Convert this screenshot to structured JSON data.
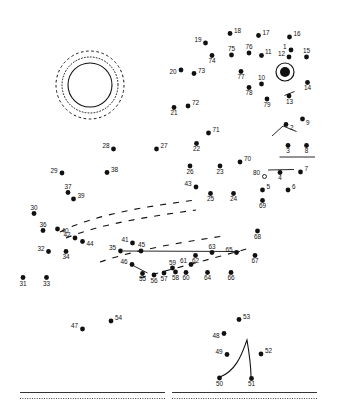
{
  "page": {
    "width": 338,
    "height": 412,
    "background_color": "#ffffff",
    "ink_color": "#111111"
  },
  "dots": {
    "marker_radius": 2.4,
    "label_font_size": 6.4,
    "items": [
      {
        "n": "1",
        "x": 291.0,
        "y": 50.0,
        "lx": 286.5,
        "ly": 48.5,
        "anchor": "end"
      },
      {
        "n": "2",
        "x": 286.0,
        "y": 124.5,
        "lx": 290.0,
        "ly": 129.5,
        "anchor": "start"
      },
      {
        "n": "3",
        "x": 288.0,
        "y": 145.5,
        "lx": 288.0,
        "ly": 153.0,
        "anchor": "middle"
      },
      {
        "n": "4",
        "x": 280.0,
        "y": 172.5,
        "lx": 280.0,
        "ly": 180.0,
        "anchor": "middle"
      },
      {
        "n": "5",
        "x": 262.5,
        "y": 190.0,
        "lx": 266.5,
        "ly": 189.0,
        "anchor": "start"
      },
      {
        "n": "6",
        "x": 288.0,
        "y": 190.0,
        "lx": 292.0,
        "ly": 189.0,
        "anchor": "start"
      },
      {
        "n": "7",
        "x": 300.5,
        "y": 172.0,
        "lx": 304.5,
        "ly": 171.0,
        "anchor": "start"
      },
      {
        "n": "8",
        "x": 306.5,
        "y": 145.5,
        "lx": 306.5,
        "ly": 153.0,
        "anchor": "middle"
      },
      {
        "n": "9",
        "x": 302.5,
        "y": 119.0,
        "lx": 306.0,
        "ly": 124.5,
        "anchor": "start"
      },
      {
        "n": "10",
        "x": 261.5,
        "y": 84.0,
        "lx": 261.5,
        "ly": 80.0,
        "anchor": "middle"
      },
      {
        "n": "11",
        "x": 261.5,
        "y": 55.5,
        "lx": 265.0,
        "ly": 54.0,
        "anchor": "start"
      },
      {
        "n": "12",
        "x": 289.0,
        "y": 57.0,
        "lx": 285.0,
        "ly": 55.5,
        "anchor": "end"
      },
      {
        "n": "13",
        "x": 289.0,
        "y": 96.0,
        "lx": 289.5,
        "ly": 103.5,
        "anchor": "middle"
      },
      {
        "n": "14",
        "x": 307.5,
        "y": 82.5,
        "lx": 307.5,
        "ly": 90.0,
        "anchor": "middle"
      },
      {
        "n": "15",
        "x": 306.5,
        "y": 57.0,
        "lx": 306.5,
        "ly": 53.0,
        "anchor": "middle"
      },
      {
        "n": "16",
        "x": 289.5,
        "y": 37.0,
        "lx": 293.5,
        "ly": 36.0,
        "anchor": "start"
      },
      {
        "n": "17",
        "x": 258.5,
        "y": 35.5,
        "lx": 262.5,
        "ly": 34.5,
        "anchor": "start"
      },
      {
        "n": "18",
        "x": 230.0,
        "y": 33.5,
        "lx": 234.0,
        "ly": 32.5,
        "anchor": "start"
      },
      {
        "n": "19",
        "x": 205.5,
        "y": 43.0,
        "lx": 201.5,
        "ly": 42.0,
        "anchor": "end"
      },
      {
        "n": "20",
        "x": 181.0,
        "y": 70.0,
        "lx": 176.5,
        "ly": 74.0,
        "anchor": "end"
      },
      {
        "n": "21",
        "x": 174.0,
        "y": 107.5,
        "lx": 174.0,
        "ly": 115.0,
        "anchor": "middle"
      },
      {
        "n": "22",
        "x": 196.5,
        "y": 143.5,
        "lx": 196.5,
        "ly": 151.0,
        "anchor": "middle"
      },
      {
        "n": "23",
        "x": 220.0,
        "y": 166.0,
        "lx": 220.0,
        "ly": 173.5,
        "anchor": "middle"
      },
      {
        "n": "24",
        "x": 233.5,
        "y": 193.5,
        "lx": 233.5,
        "ly": 201.0,
        "anchor": "middle"
      },
      {
        "n": "25",
        "x": 210.5,
        "y": 193.5,
        "lx": 210.5,
        "ly": 201.0,
        "anchor": "middle"
      },
      {
        "n": "26",
        "x": 190.0,
        "y": 166.0,
        "lx": 190.0,
        "ly": 173.5,
        "anchor": "middle"
      },
      {
        "n": "27",
        "x": 156.5,
        "y": 149.0,
        "lx": 160.5,
        "ly": 148.0,
        "anchor": "start"
      },
      {
        "n": "28",
        "x": 113.5,
        "y": 149.0,
        "lx": 109.5,
        "ly": 148.0,
        "anchor": "end"
      },
      {
        "n": "29",
        "x": 62.0,
        "y": 173.0,
        "lx": 57.5,
        "ly": 172.5,
        "anchor": "end"
      },
      {
        "n": "30",
        "x": 34.0,
        "y": 213.5,
        "lx": 34.0,
        "ly": 209.5,
        "anchor": "middle"
      },
      {
        "n": "31",
        "x": 23.0,
        "y": 277.5,
        "lx": 23.0,
        "ly": 285.5,
        "anchor": "middle"
      },
      {
        "n": "32",
        "x": 48.5,
        "y": 251.5,
        "lx": 44.5,
        "ly": 250.5,
        "anchor": "end"
      },
      {
        "n": "33",
        "x": 46.5,
        "y": 277.5,
        "lx": 46.5,
        "ly": 285.5,
        "anchor": "middle"
      },
      {
        "n": "34",
        "x": 66.0,
        "y": 251.5,
        "lx": 66.0,
        "ly": 259.0,
        "anchor": "middle"
      },
      {
        "n": "35",
        "x": 120.5,
        "y": 251.0,
        "lx": 116.0,
        "ly": 250.0,
        "anchor": "end"
      },
      {
        "n": "36",
        "x": 43.0,
        "y": 230.5,
        "lx": 43.0,
        "ly": 226.5,
        "anchor": "middle"
      },
      {
        "n": "37",
        "x": 68.0,
        "y": 192.5,
        "lx": 68.0,
        "ly": 188.5,
        "anchor": "middle"
      },
      {
        "n": "38",
        "x": 107.0,
        "y": 172.5,
        "lx": 111.0,
        "ly": 171.5,
        "anchor": "start"
      },
      {
        "n": "39",
        "x": 73.5,
        "y": 199.0,
        "lx": 77.5,
        "ly": 198.0,
        "anchor": "start"
      },
      {
        "n": "40",
        "x": 57.5,
        "y": 229.0,
        "lx": 61.5,
        "ly": 232.5,
        "anchor": "start"
      },
      {
        "n": "41",
        "x": 132.5,
        "y": 243.0,
        "lx": 128.5,
        "ly": 242.0,
        "anchor": "end"
      },
      {
        "n": "42",
        "x": 75.0,
        "y": 238.0,
        "lx": 70.5,
        "ly": 237.0,
        "anchor": "end"
      },
      {
        "n": "43",
        "x": 196.0,
        "y": 187.0,
        "lx": 191.5,
        "ly": 186.0,
        "anchor": "end"
      },
      {
        "n": "44",
        "x": 82.5,
        "y": 241.5,
        "lx": 86.5,
        "ly": 245.5,
        "anchor": "start"
      },
      {
        "n": "45",
        "x": 141.0,
        "y": 251.0,
        "lx": 141.5,
        "ly": 247.0,
        "anchor": "middle"
      },
      {
        "n": "46",
        "x": 132.0,
        "y": 264.5,
        "lx": 127.5,
        "ly": 263.5,
        "anchor": "end"
      },
      {
        "n": "47",
        "x": 82.5,
        "y": 329.0,
        "lx": 78.0,
        "ly": 328.0,
        "anchor": "end"
      },
      {
        "n": "48",
        "x": 224.0,
        "y": 333.5,
        "lx": 219.5,
        "ly": 337.5,
        "anchor": "end"
      },
      {
        "n": "49",
        "x": 227.0,
        "y": 354.5,
        "lx": 222.5,
        "ly": 353.5,
        "anchor": "end"
      },
      {
        "n": "50",
        "x": 219.5,
        "y": 378.0,
        "lx": 219.5,
        "ly": 385.5,
        "anchor": "middle"
      },
      {
        "n": "51",
        "x": 251.5,
        "y": 378.5,
        "lx": 251.5,
        "ly": 386.0,
        "anchor": "middle"
      },
      {
        "n": "52",
        "x": 261.0,
        "y": 354.0,
        "lx": 265.0,
        "ly": 353.0,
        "anchor": "start"
      },
      {
        "n": "53",
        "x": 239.0,
        "y": 319.5,
        "lx": 243.0,
        "ly": 318.5,
        "anchor": "start"
      },
      {
        "n": "54",
        "x": 111.0,
        "y": 321.0,
        "lx": 115.0,
        "ly": 320.0,
        "anchor": "start"
      },
      {
        "n": "55",
        "x": 142.5,
        "y": 273.5,
        "lx": 142.5,
        "ly": 281.0,
        "anchor": "middle"
      },
      {
        "n": "56",
        "x": 154.0,
        "y": 275.0,
        "lx": 154.0,
        "ly": 282.5,
        "anchor": "middle"
      },
      {
        "n": "57",
        "x": 164.0,
        "y": 273.0,
        "lx": 164.0,
        "ly": 280.5,
        "anchor": "middle"
      },
      {
        "n": "58",
        "x": 175.5,
        "y": 272.0,
        "lx": 175.5,
        "ly": 279.5,
        "anchor": "middle"
      },
      {
        "n": "59",
        "x": 172.5,
        "y": 268.0,
        "lx": 172.5,
        "ly": 264.5,
        "anchor": "middle"
      },
      {
        "n": "60",
        "x": 186.0,
        "y": 272.5,
        "lx": 186.0,
        "ly": 280.0,
        "anchor": "middle"
      },
      {
        "n": "61",
        "x": 191.0,
        "y": 264.5,
        "lx": 187.0,
        "ly": 263.0,
        "anchor": "end"
      },
      {
        "n": "62",
        "x": 195.5,
        "y": 255.5,
        "lx": 195.5,
        "ly": 263.0,
        "anchor": "middle"
      },
      {
        "n": "63",
        "x": 212.0,
        "y": 252.5,
        "lx": 212.0,
        "ly": 248.5,
        "anchor": "middle"
      },
      {
        "n": "64",
        "x": 207.5,
        "y": 272.5,
        "lx": 207.5,
        "ly": 280.0,
        "anchor": "middle"
      },
      {
        "n": "65",
        "x": 236.5,
        "y": 252.5,
        "lx": 232.5,
        "ly": 251.5,
        "anchor": "end"
      },
      {
        "n": "66",
        "x": 231.0,
        "y": 272.5,
        "lx": 231.0,
        "ly": 280.0,
        "anchor": "middle"
      },
      {
        "n": "67",
        "x": 255.0,
        "y": 255.5,
        "lx": 255.0,
        "ly": 263.0,
        "anchor": "middle"
      },
      {
        "n": "68",
        "x": 257.5,
        "y": 231.0,
        "lx": 257.5,
        "ly": 238.5,
        "anchor": "middle"
      },
      {
        "n": "69",
        "x": 262.5,
        "y": 200.5,
        "lx": 262.5,
        "ly": 208.0,
        "anchor": "middle"
      },
      {
        "n": "70",
        "x": 240.0,
        "y": 162.0,
        "lx": 244.0,
        "ly": 161.0,
        "anchor": "start"
      },
      {
        "n": "71",
        "x": 208.5,
        "y": 133.0,
        "lx": 212.5,
        "ly": 132.0,
        "anchor": "start"
      },
      {
        "n": "72",
        "x": 188.0,
        "y": 106.0,
        "lx": 192.0,
        "ly": 105.0,
        "anchor": "start"
      },
      {
        "n": "73",
        "x": 194.0,
        "y": 73.5,
        "lx": 198.0,
        "ly": 72.5,
        "anchor": "start"
      },
      {
        "n": "74",
        "x": 212.0,
        "y": 55.5,
        "lx": 212.0,
        "ly": 63.0,
        "anchor": "middle"
      },
      {
        "n": "75",
        "x": 231.5,
        "y": 55.0,
        "lx": 231.5,
        "ly": 51.0,
        "anchor": "middle"
      },
      {
        "n": "76",
        "x": 249.0,
        "y": 53.0,
        "lx": 249.0,
        "ly": 49.0,
        "anchor": "middle"
      },
      {
        "n": "77",
        "x": 241.0,
        "y": 71.5,
        "lx": 241.0,
        "ly": 79.0,
        "anchor": "middle"
      },
      {
        "n": "78",
        "x": 249.0,
        "y": 87.5,
        "lx": 249.0,
        "ly": 95.0,
        "anchor": "middle"
      },
      {
        "n": "79",
        "x": 267.0,
        "y": 99.0,
        "lx": 267.0,
        "ly": 106.5,
        "anchor": "middle"
      },
      {
        "n": "80",
        "x": 264.5,
        "y": 176.5,
        "lx": 260.0,
        "ly": 175.0,
        "anchor": "end",
        "hollow": true
      }
    ]
  },
  "shapes": {
    "target_left": {
      "name": "concentric-rings-left",
      "cx": 90.0,
      "cy": 85.0,
      "solid_r": 22.0,
      "dotted_r": 28.0,
      "dashed_r": 34.0
    },
    "target_right": {
      "name": "ring-with-filled-center",
      "cx": 285.0,
      "cy": 72.0,
      "ring_r": 9.0,
      "center_r": 5.0
    },
    "guide_strokes": [
      {
        "x1": 296.5,
        "y1": 131.5,
        "x2": 283.0,
        "y2": 126.0
      },
      {
        "x1": 283.0,
        "y1": 126.0,
        "x2": 272.0,
        "y2": 136.0
      },
      {
        "x1": 284.5,
        "y1": 95.5,
        "x2": 294.5,
        "y2": 91.5
      },
      {
        "x1": 279.5,
        "y1": 157.0,
        "x2": 315.0,
        "y2": 157.0
      },
      {
        "x1": 268.0,
        "y1": 170.0,
        "x2": 294.0,
        "y2": 169.5
      },
      {
        "x1": 123.0,
        "y1": 251.0,
        "x2": 240.0,
        "y2": 251.5
      },
      {
        "x1": 134.0,
        "y1": 266.0,
        "x2": 147.5,
        "y2": 273.0
      }
    ],
    "dashed_arcs": [
      {
        "d": "M 60,232 C 95,214 150,206 196,200"
      },
      {
        "d": "M 66,238 C 100,224 152,216 196,210"
      },
      {
        "d": "M 100,262 C 135,250 182,242 224,236"
      },
      {
        "d": "M 140,278 C 175,268 215,258 250,248"
      }
    ],
    "curve_50_51": {
      "d": "M 220,377 C 238,370 243,350 247,340 C 249,352 251,368 251,377"
    }
  },
  "footer_rules": [
    {
      "name": "footer-rule-left",
      "x1": 20,
      "x2": 165,
      "y_solid": 392.5,
      "y_dotted": 398.5
    },
    {
      "name": "footer-rule-right",
      "x1": 172,
      "x2": 317,
      "y_solid": 392.5,
      "y_dotted": 398.5
    }
  ]
}
